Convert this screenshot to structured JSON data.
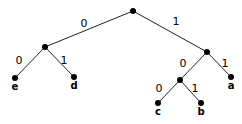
{
  "diagram": {
    "type": "binary-tree",
    "edge_color": "#222222",
    "node_color": "#000000",
    "nodes": [
      {
        "id": "root",
        "x": 133,
        "y": 11,
        "label": ""
      },
      {
        "id": "n_left",
        "x": 45,
        "y": 47,
        "label": ""
      },
      {
        "id": "n_right",
        "x": 207,
        "y": 52,
        "label": ""
      },
      {
        "id": "e",
        "x": 15,
        "y": 78,
        "label": "e"
      },
      {
        "id": "d",
        "x": 74,
        "y": 77,
        "label": "d"
      },
      {
        "id": "n_inner",
        "x": 180,
        "y": 80,
        "label": ""
      },
      {
        "id": "a",
        "x": 231,
        "y": 77,
        "label": "a"
      },
      {
        "id": "c",
        "x": 158,
        "y": 103,
        "label": "c"
      },
      {
        "id": "b",
        "x": 201,
        "y": 103,
        "label": "b"
      }
    ],
    "edges": [
      {
        "from": "root",
        "to": "n_left",
        "label": "0",
        "lx": 84,
        "ly": 27
      },
      {
        "from": "root",
        "to": "n_right",
        "label": "1",
        "lx": 176,
        "ly": 25
      },
      {
        "from": "n_left",
        "to": "e",
        "label": "0",
        "lx": 19,
        "ly": 64
      },
      {
        "from": "n_left",
        "to": "d",
        "label": "1",
        "lx": 64,
        "ly": 64
      },
      {
        "from": "n_right",
        "to": "n_inner",
        "label": "0",
        "lx": 183,
        "ly": 67
      },
      {
        "from": "n_right",
        "to": "a",
        "label": "1",
        "lx": 225,
        "ly": 67
      },
      {
        "from": "n_inner",
        "to": "c",
        "label": "0",
        "lx": 159,
        "ly": 92
      },
      {
        "from": "n_inner",
        "to": "b",
        "label": "1",
        "lx": 195,
        "ly": 92
      }
    ],
    "codes": {
      "e": "00",
      "d": "01",
      "c": "100",
      "b": "101",
      "a": "11"
    }
  }
}
